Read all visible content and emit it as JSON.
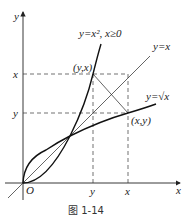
{
  "figure": {
    "caption": "图 1-14",
    "axes": {
      "x_label": "x",
      "y_label": "y",
      "origin_label": "O"
    },
    "curves": [
      {
        "name": "parabola",
        "label": "y=x², x≥0"
      },
      {
        "name": "identity",
        "label": "y=x"
      },
      {
        "name": "sqrt",
        "label": "y=√x"
      }
    ],
    "points": {
      "p1": "(y,x)",
      "p2": "(x,y)"
    },
    "ticks": {
      "x_axis": [
        "y",
        "x"
      ],
      "y_axis": [
        "x",
        "y"
      ]
    },
    "colors": {
      "line": "#222222",
      "background": "#ffffff"
    }
  }
}
